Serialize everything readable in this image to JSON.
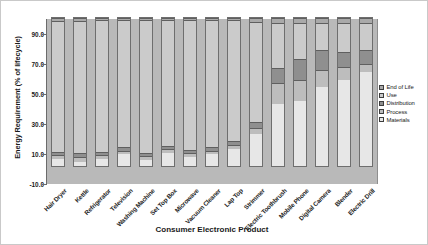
{
  "chart_data": {
    "type": "bar",
    "stacked": true,
    "title": "",
    "xlabel": "Consumer Electronic Product",
    "ylabel": "Energy Requirement (% of lifecycle)",
    "ylim": [
      -10.0,
      100.0
    ],
    "yticks": [
      "-10.0",
      "10.0",
      "30.0",
      "50.0",
      "70.0",
      "90.0"
    ],
    "ytick_values": [
      -10.0,
      10.0,
      30.0,
      50.0,
      70.0,
      90.0
    ],
    "grid": false,
    "legend_position": "right",
    "legend": [
      "End of Life",
      "Use",
      "Distribution",
      "Process",
      "Materials"
    ],
    "categories": [
      "Hair Dryer",
      "Kettle",
      "Refrigerator",
      "Television",
      "Washing Machine",
      "Set Top Box",
      "Microwave",
      "Vacuum Cleaner",
      "Lap Top",
      "Strimmer",
      "Electric Toothbrush",
      "Mobile Phone",
      "Digital Camera",
      "Blender",
      "Electric Drill"
    ],
    "series": [
      {
        "name": "Materials",
        "values": [
          5.0,
          3.0,
          5.0,
          8.0,
          4.0,
          9.0,
          6.0,
          8.0,
          12.0,
          22.0,
          43.0,
          45.0,
          55.0,
          60.0,
          65.0
        ]
      },
      {
        "name": "Process",
        "values": [
          2.0,
          2.5,
          2.0,
          2.0,
          2.0,
          2.0,
          2.0,
          2.0,
          2.0,
          4.0,
          14.0,
          14.0,
          11.0,
          8.0,
          5.0
        ]
      },
      {
        "name": "Distribution",
        "values": [
          1.5,
          2.0,
          1.5,
          1.5,
          1.5,
          1.5,
          1.5,
          2.0,
          2.0,
          3.0,
          10.0,
          14.0,
          13.0,
          10.0,
          9.0
        ]
      },
      {
        "name": "Use",
        "values": [
          90.0,
          91.0,
          90.5,
          87.5,
          91.5,
          86.5,
          89.5,
          87.0,
          83.0,
          69.0,
          30.0,
          24.0,
          18.0,
          19.0,
          18.0
        ]
      },
      {
        "name": "End of Life",
        "values": [
          1.5,
          1.5,
          1.0,
          1.0,
          1.0,
          1.0,
          1.0,
          1.0,
          1.0,
          2.0,
          3.0,
          3.0,
          3.0,
          3.0,
          3.0
        ]
      }
    ]
  }
}
